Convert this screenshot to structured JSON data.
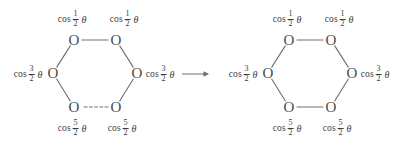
{
  "figure": {
    "background_color": "#ffffff",
    "stroke_color": "#6e6e6e",
    "text_color": "#3d3d3d",
    "atom_symbol": "O",
    "function_name": "cos",
    "theta_symbol": "θ",
    "arrow": {
      "name": "transformation-arrow",
      "direction": "right",
      "x1": 182,
      "y1": 74,
      "x2": 209,
      "y2": 74
    },
    "structures": [
      {
        "id": "left-hexagon",
        "center_x": 95,
        "center_y": 73,
        "bottom_bond_style": "dashed",
        "vertices": [
          {
            "id": "top-left",
            "x": 74,
            "y": 40
          },
          {
            "id": "top-right",
            "x": 116,
            "y": 40
          },
          {
            "id": "middle-right",
            "x": 137,
            "y": 73
          },
          {
            "id": "bottom-right",
            "x": 116,
            "y": 107
          },
          {
            "id": "bottom-left",
            "x": 74,
            "y": 107
          },
          {
            "id": "middle-left",
            "x": 53,
            "y": 73
          }
        ],
        "labels": [
          {
            "id": "label-top-left",
            "numerator": "1",
            "denominator": "2",
            "x": 72,
            "y": 19,
            "anchor": "above"
          },
          {
            "id": "label-top-right",
            "numerator": "1",
            "denominator": "2",
            "x": 124,
            "y": 19,
            "anchor": "above"
          },
          {
            "id": "label-middle-right",
            "numerator": "3",
            "denominator": "2",
            "x": 160,
            "y": 74,
            "anchor": "right"
          },
          {
            "id": "label-bottom-right",
            "numerator": "5",
            "denominator": "2",
            "x": 122,
            "y": 128,
            "anchor": "below"
          },
          {
            "id": "label-bottom-left",
            "numerator": "5",
            "denominator": "2",
            "x": 72,
            "y": 128,
            "anchor": "below"
          },
          {
            "id": "label-middle-left",
            "numerator": "3",
            "denominator": "2",
            "x": 28,
            "y": 74,
            "anchor": "left"
          }
        ]
      },
      {
        "id": "right-hexagon",
        "center_x": 310,
        "center_y": 73,
        "bottom_bond_style": "solid",
        "vertices": [
          {
            "id": "top-left",
            "x": 289,
            "y": 40
          },
          {
            "id": "top-right",
            "x": 331,
            "y": 40
          },
          {
            "id": "middle-right",
            "x": 352,
            "y": 73
          },
          {
            "id": "bottom-right",
            "x": 331,
            "y": 107
          },
          {
            "id": "bottom-left",
            "x": 289,
            "y": 107
          },
          {
            "id": "middle-left",
            "x": 268,
            "y": 73
          }
        ],
        "labels": [
          {
            "id": "label-top-left",
            "numerator": "1",
            "denominator": "2",
            "x": 287,
            "y": 19,
            "anchor": "above"
          },
          {
            "id": "label-top-right",
            "numerator": "1",
            "denominator": "2",
            "x": 339,
            "y": 19,
            "anchor": "above"
          },
          {
            "id": "label-middle-right",
            "numerator": "3",
            "denominator": "2",
            "x": 375,
            "y": 74,
            "anchor": "right"
          },
          {
            "id": "label-bottom-right",
            "numerator": "5",
            "denominator": "2",
            "x": 337,
            "y": 128,
            "anchor": "below"
          },
          {
            "id": "label-bottom-left",
            "numerator": "5",
            "denominator": "2",
            "x": 287,
            "y": 128,
            "anchor": "below"
          },
          {
            "id": "label-middle-left",
            "numerator": "3",
            "denominator": "2",
            "x": 243,
            "y": 74,
            "anchor": "left"
          }
        ]
      }
    ]
  }
}
